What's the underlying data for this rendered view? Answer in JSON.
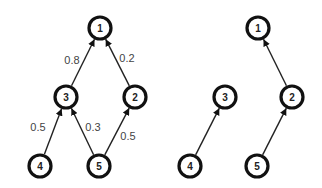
{
  "diagrams": [
    {
      "name": "weighted-graph",
      "nodes": [
        {
          "id": "1",
          "label": "1",
          "x": 100,
          "y": 28
        },
        {
          "id": "2",
          "label": "2",
          "x": 135,
          "y": 97
        },
        {
          "id": "3",
          "label": "3",
          "x": 66,
          "y": 97
        },
        {
          "id": "4",
          "label": "4",
          "x": 40,
          "y": 166
        },
        {
          "id": "5",
          "label": "5",
          "x": 99,
          "y": 166
        }
      ],
      "edges": [
        {
          "from": "3",
          "to": "1",
          "weight": "0.8",
          "lx": 72,
          "ly": 60
        },
        {
          "from": "2",
          "to": "1",
          "weight": "0.2",
          "lx": 127,
          "ly": 58
        },
        {
          "from": "4",
          "to": "3",
          "weight": "0.5",
          "lx": 38,
          "ly": 127
        },
        {
          "from": "5",
          "to": "3",
          "weight": "0.3",
          "lx": 93,
          "ly": 127
        },
        {
          "from": "5",
          "to": "2",
          "weight": "0.5",
          "lx": 128,
          "ly": 136
        }
      ]
    },
    {
      "name": "tree",
      "nodes": [
        {
          "id": "1",
          "label": "1",
          "x": 258,
          "y": 28
        },
        {
          "id": "2",
          "label": "2",
          "x": 292,
          "y": 97
        },
        {
          "id": "3",
          "label": "3",
          "x": 225,
          "y": 97
        },
        {
          "id": "4",
          "label": "4",
          "x": 190,
          "y": 166
        },
        {
          "id": "5",
          "label": "5",
          "x": 257,
          "y": 166
        }
      ],
      "edges": [
        {
          "from": "2",
          "to": "1",
          "weight": ""
        },
        {
          "from": "4",
          "to": "3",
          "weight": ""
        },
        {
          "from": "5",
          "to": "2",
          "weight": ""
        }
      ]
    }
  ],
  "style": {
    "node_radius": 11,
    "stroke": "#111111",
    "background": "#ffffff"
  }
}
